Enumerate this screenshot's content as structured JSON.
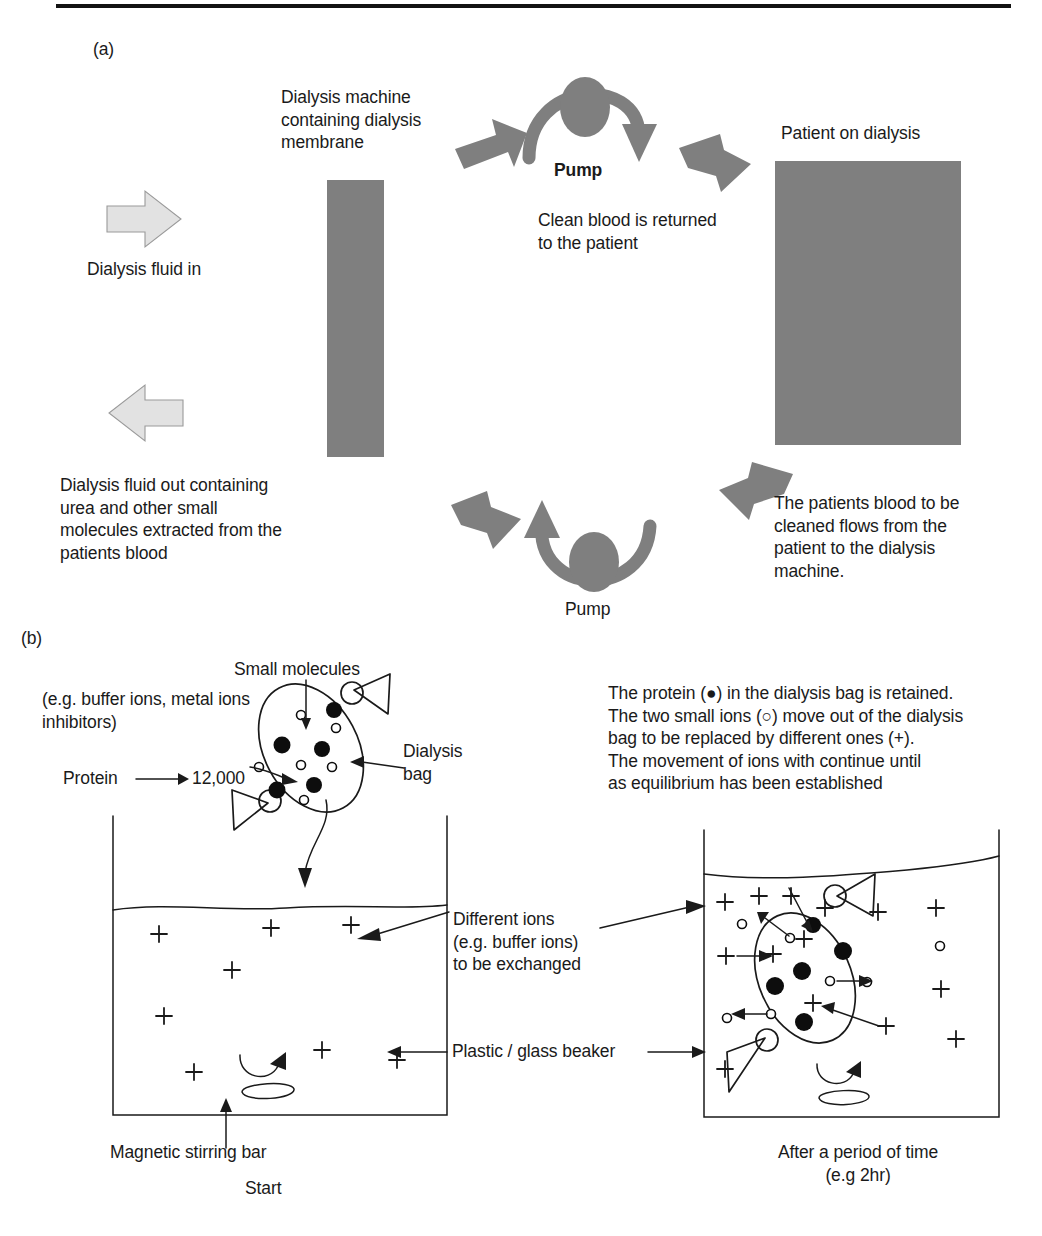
{
  "figure": {
    "panels": [
      {
        "id": "a",
        "label": "(a)"
      },
      {
        "id": "b",
        "label": "(b)"
      }
    ]
  },
  "panel_a": {
    "label": "(a)",
    "dialysis_fluid_in": "Dialysis fluid in",
    "dialysis_machine_label": "Dialysis machine\ncontaining dialysis\nmembrane",
    "pump_top_label": "Pump",
    "clean_blood_text": "Clean blood is returned\nto the patient",
    "patient_label": "Patient on dialysis",
    "dialysis_fluid_out": "Dialysis fluid out containing\nurea and other small\nmolecules extracted from the\npatients blood",
    "pump_bottom_label": "Pump",
    "patients_blood_text": "The patients blood to be\ncleaned flows from the\npatient to the dialysis\nmachine.",
    "colors": {
      "dark_gray": "#7f7f7f",
      "light_gray": "#e2e2e2",
      "light_gray_stroke": "#9a9a9a"
    }
  },
  "panel_b": {
    "label": "(b)",
    "small_molecules_label": "Small molecules",
    "small_molecules_examples": "(e.g. buffer ions, metal ions\ninhibitors)",
    "protein_label": "Protein",
    "protein_mw": "12,000",
    "protein_arrow_glyph": "⟶",
    "dialysis_bag_label": "Dialysis\nbag",
    "explanation": "The protein (●) in the dialysis bag is retained.\nThe two small ions (○) move out of the dialysis\nbag to be replaced by different ones (+).\nThe movement of ions with continue until\nas equilibrium has been established",
    "different_ions_label": "Different ions\n(e.g. buffer ions)\nto be exchanged",
    "beaker_label": "Plastic / glass beaker",
    "stirring_bar_label": "Magnetic stirring bar",
    "left_caption": "Start",
    "right_caption": "After a period of time\n(e.g 2hr)",
    "legend": {
      "protein_symbol": "●",
      "small_ion_symbol": "○",
      "different_ion_symbol": "+"
    }
  }
}
